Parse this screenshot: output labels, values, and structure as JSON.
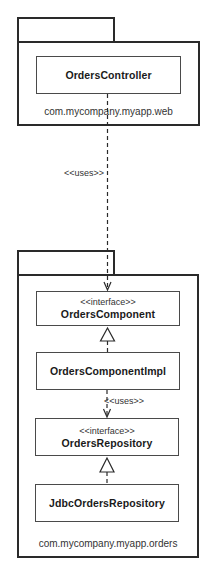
{
  "diagram": {
    "type": "uml-package-diagram",
    "packages": [
      {
        "id": "web",
        "label": "com.mycompany.myapp.web",
        "classes": [
          {
            "id": "ordersController",
            "name": "OrdersController",
            "stereotype": null
          }
        ]
      },
      {
        "id": "orders",
        "label": "com.mycompany.myapp.orders",
        "classes": [
          {
            "id": "ordersComponent",
            "name": "OrdersComponent",
            "stereotype": "<<interface>>"
          },
          {
            "id": "ordersComponentImpl",
            "name": "OrdersComponentImpl",
            "stereotype": null
          },
          {
            "id": "ordersRepository",
            "name": "OrdersRepository",
            "stereotype": "<<interface>>"
          },
          {
            "id": "jdbcOrdersRepository",
            "name": "JdbcOrdersRepository",
            "stereotype": null
          }
        ]
      }
    ],
    "relationships": [
      {
        "from": "OrdersController",
        "to": "OrdersComponent",
        "kind": "dependency",
        "label": "<<uses>>"
      },
      {
        "from": "OrdersComponentImpl",
        "to": "OrdersComponent",
        "kind": "realization",
        "label": ""
      },
      {
        "from": "OrdersComponentImpl",
        "to": "OrdersRepository",
        "kind": "dependency",
        "label": "<<uses>>"
      },
      {
        "from": "JdbcOrdersRepository",
        "to": "OrdersRepository",
        "kind": "realization",
        "label": ""
      }
    ],
    "colors": {
      "line": "#2a2a2a",
      "background": "#ffffff"
    }
  }
}
